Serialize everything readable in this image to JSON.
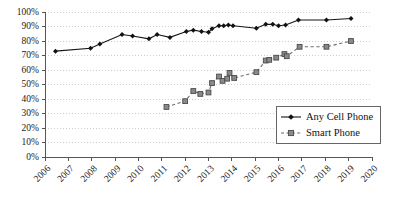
{
  "chart_data": {
    "type": "line",
    "title": "",
    "subtitle": "",
    "xlabel": "",
    "ylabel": "",
    "xlim": [
      2006,
      2020
    ],
    "ylim": [
      0,
      100
    ],
    "grid": true,
    "grid_axis": "y",
    "legend_position": "bottom-right",
    "x_tick_labels": [
      "2006",
      "2007",
      "2008",
      "2009",
      "2010",
      "2011",
      "2012",
      "2013",
      "2014",
      "2015",
      "2016",
      "2017",
      "2018",
      "2019",
      "2020"
    ],
    "x_tick_values": [
      2006,
      2007,
      2008,
      2009,
      2010,
      2011,
      2012,
      2013,
      2014,
      2015,
      2016,
      2017,
      2018,
      2019,
      2020
    ],
    "y_tick_labels": [
      "0%",
      "10%",
      "20%",
      "30%",
      "40%",
      "50%",
      "60%",
      "70%",
      "80%",
      "90%",
      "100%"
    ],
    "y_tick_values": [
      0,
      10,
      20,
      30,
      40,
      50,
      60,
      70,
      80,
      90,
      100
    ],
    "series": [
      {
        "name": "Any Cell Phone",
        "marker": "diamond",
        "line_style": "solid",
        "color": "#151515",
        "points": [
          {
            "x": 2006.45,
            "y": 73.0
          },
          {
            "x": 2007.95,
            "y": 75.0
          },
          {
            "x": 2008.35,
            "y": 78.0
          },
          {
            "x": 2009.3,
            "y": 84.5
          },
          {
            "x": 2009.75,
            "y": 83.5
          },
          {
            "x": 2010.45,
            "y": 81.5
          },
          {
            "x": 2010.8,
            "y": 84.5
          },
          {
            "x": 2011.35,
            "y": 82.5
          },
          {
            "x": 2012.05,
            "y": 86.5
          },
          {
            "x": 2012.35,
            "y": 87.5
          },
          {
            "x": 2012.7,
            "y": 86.5
          },
          {
            "x": 2013.0,
            "y": 86.0
          },
          {
            "x": 2013.15,
            "y": 88.5
          },
          {
            "x": 2013.45,
            "y": 90.5
          },
          {
            "x": 2013.65,
            "y": 90.5
          },
          {
            "x": 2013.85,
            "y": 91.0
          },
          {
            "x": 2014.05,
            "y": 90.5
          },
          {
            "x": 2015.05,
            "y": 88.8
          },
          {
            "x": 2015.45,
            "y": 91.5
          },
          {
            "x": 2015.75,
            "y": 91.5
          },
          {
            "x": 2016.0,
            "y": 90.5
          },
          {
            "x": 2016.3,
            "y": 91.0
          },
          {
            "x": 2016.85,
            "y": 94.5
          },
          {
            "x": 2018.05,
            "y": 94.5
          },
          {
            "x": 2019.1,
            "y": 95.5
          }
        ]
      },
      {
        "name": "Smart Phone",
        "marker": "square",
        "line_style": "dashed",
        "color": "#8a8a8a",
        "points": [
          {
            "x": 2011.2,
            "y": 34.5
          },
          {
            "x": 2012.0,
            "y": 38.5
          },
          {
            "x": 2012.35,
            "y": 45.5
          },
          {
            "x": 2012.65,
            "y": 43.5
          },
          {
            "x": 2013.0,
            "y": 44.5
          },
          {
            "x": 2013.15,
            "y": 51.0
          },
          {
            "x": 2013.45,
            "y": 55.5
          },
          {
            "x": 2013.6,
            "y": 52.5
          },
          {
            "x": 2013.8,
            "y": 54.0
          },
          {
            "x": 2013.9,
            "y": 58.0
          },
          {
            "x": 2014.1,
            "y": 54.5
          },
          {
            "x": 2015.05,
            "y": 58.5
          },
          {
            "x": 2015.45,
            "y": 66.5
          },
          {
            "x": 2015.6,
            "y": 67.0
          },
          {
            "x": 2015.9,
            "y": 68.5
          },
          {
            "x": 2016.25,
            "y": 71.0
          },
          {
            "x": 2016.35,
            "y": 69.5
          },
          {
            "x": 2016.9,
            "y": 76.0
          },
          {
            "x": 2018.05,
            "y": 76.0
          },
          {
            "x": 2019.1,
            "y": 80.0
          }
        ]
      }
    ],
    "legend": [
      {
        "label": "Any Cell Phone",
        "marker": "diamond",
        "line_style": "solid"
      },
      {
        "label": "Smart Phone",
        "marker": "square",
        "line_style": "dashed"
      }
    ]
  }
}
